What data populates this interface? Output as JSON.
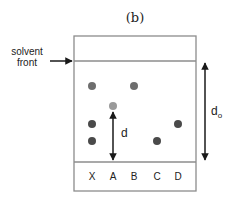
{
  "figure": {
    "panel_label": "(b)",
    "solvent_front_label_line1": "solvent",
    "solvent_front_label_line2": "front",
    "distance_label": "d",
    "total_distance_label": "d",
    "total_distance_subscript": "o",
    "lanes": [
      "X",
      "A",
      "B",
      "C",
      "D"
    ],
    "colors": {
      "outline": "#8c8c8c",
      "spot_dark": "#4a4a4a",
      "spot_medium": "#6e6e6e",
      "spot_light": "#9a9a9a",
      "arrow": "#1a1a1a",
      "text": "#222222"
    }
  }
}
